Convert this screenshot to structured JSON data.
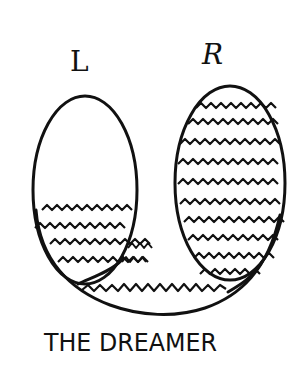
{
  "diagram": {
    "left_label": "L",
    "right_label": "R",
    "caption": "THE DREAMER",
    "stroke_color": "#111111",
    "background": "#ffffff",
    "left_shape": {
      "type": "ellipse",
      "fill_pattern": "wavy-lines",
      "wavy_lines_count": 4,
      "fill_level": "bottom quarter"
    },
    "right_shape": {
      "type": "ellipse",
      "fill_pattern": "wavy-lines",
      "wavy_lines_count": 12,
      "fill_level": "full"
    },
    "connector": {
      "type": "u-shaped band",
      "fill_pattern": "wavy-line",
      "wavy_lines_count": 1
    }
  }
}
